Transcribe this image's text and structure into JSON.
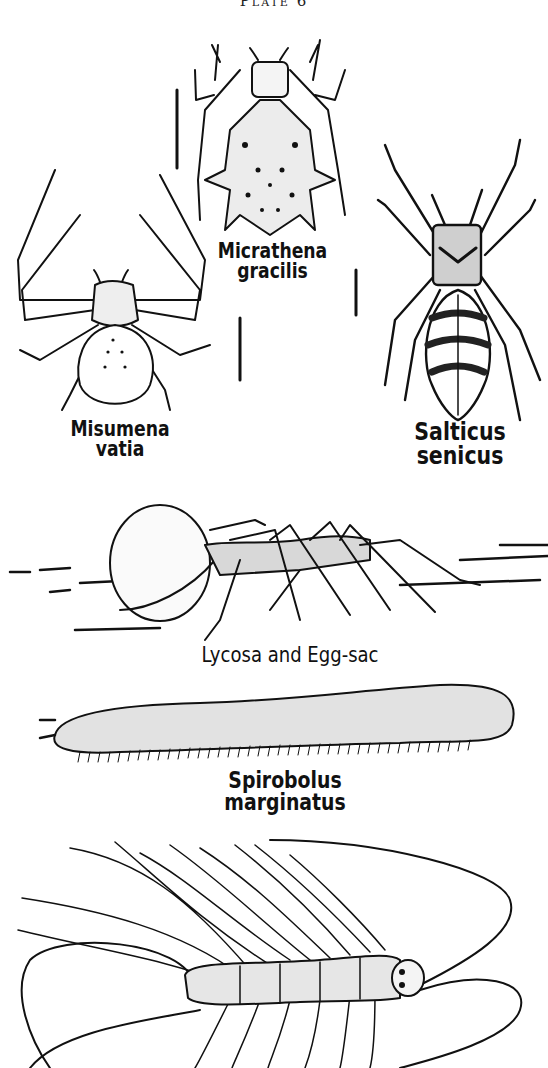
{
  "plate": {
    "title": "Plate 6"
  },
  "specimens": [
    {
      "id": "micrathena",
      "label_line1": "Micrathena",
      "label_line2": "gracilis"
    },
    {
      "id": "misumena",
      "label_line1": "Misumena",
      "label_line2": "vatia"
    },
    {
      "id": "salticus",
      "label_line1": "Salticus",
      "label_line2": "senicus"
    },
    {
      "id": "lycosa",
      "label_line1": "Lycosa and Egg-sac"
    },
    {
      "id": "spirobolus",
      "label_line1": "Spirobolus marginatus"
    },
    {
      "id": "scutigera",
      "label_line1": ""
    }
  ],
  "colors": {
    "ink": "#111111",
    "paper": "#ffffff"
  }
}
